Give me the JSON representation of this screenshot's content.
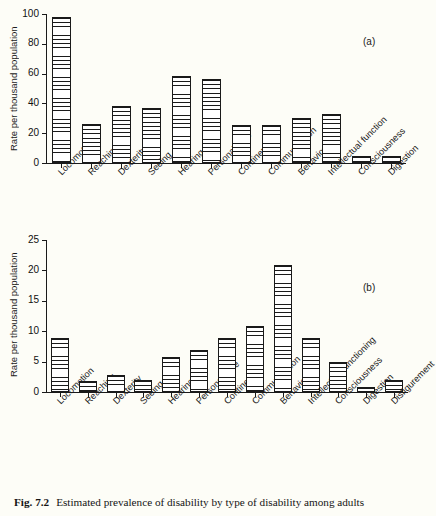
{
  "figure": {
    "caption_number": "Fig. 7.2",
    "caption_text": "Estimated prevalence of disability by type of disability among adults"
  },
  "panel_a": {
    "tag": "(a)",
    "ylabel": "Rate per thousand population",
    "yticks": [
      "0",
      "20",
      "40",
      "60",
      "80",
      "100"
    ]
  },
  "panel_b": {
    "tag": "(b)",
    "ylabel": "Rate per thousand population",
    "yticks": [
      "0",
      "5",
      "10",
      "15",
      "20",
      "25"
    ]
  },
  "chart_data": [
    {
      "type": "bar",
      "panel": "(a)",
      "title": "Estimated prevalence of disability by type of disability among adults",
      "xlabel": "",
      "ylabel": "Rate per thousand population",
      "ylim": [
        0,
        100
      ],
      "yticks": [
        0,
        20,
        40,
        60,
        80,
        100
      ],
      "grid": false,
      "legend": "none",
      "categories": [
        "Locomotion",
        "Reaching",
        "Dexterity",
        "Seeing",
        "Hearing",
        "Personal care",
        "Continence",
        "Communication",
        "Behaviour",
        "Intellectual function",
        "Consciousness",
        "Digestion"
      ],
      "values": [
        98,
        26.5,
        38.5,
        37,
        58.5,
        56.5,
        25.5,
        25.5,
        30,
        33,
        4.5,
        5
      ]
    },
    {
      "type": "bar",
      "panel": "(b)",
      "title": "Estimated prevalence of disability by type of disability among adults",
      "xlabel": "",
      "ylabel": "Rate per thousand population",
      "ylim": [
        0,
        25
      ],
      "yticks": [
        0,
        5,
        10,
        15,
        20,
        25
      ],
      "grid": false,
      "legend": "none",
      "categories": [
        "Locomotion",
        "Reaching",
        "Dexterity",
        "Seeing",
        "Hearing",
        "Personal care",
        "Continence",
        "Communication",
        "Behaviour",
        "Intellectual functioning",
        "Consciousness",
        "Digestion",
        "Disfigurement"
      ],
      "values": [
        8.9,
        1.8,
        2.8,
        1.9,
        5.8,
        6.9,
        8.9,
        10.9,
        20.9,
        8.8,
        5.0,
        0.9,
        2.0
      ]
    }
  ]
}
